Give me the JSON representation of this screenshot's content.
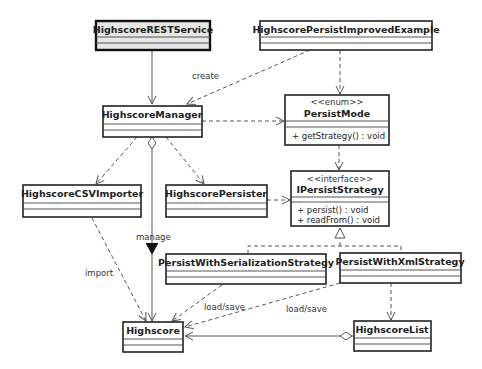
{
  "diagram": {
    "type": "uml-class-diagram",
    "classes": [
      {
        "id": "rest",
        "name": "HighscoreRESTService",
        "highlighted": true
      },
      {
        "id": "example",
        "name": "HighscorePersistImprovedExample"
      },
      {
        "id": "manager",
        "name": "HighscoreManager"
      },
      {
        "id": "mode",
        "stereotype": "<<enum>>",
        "name": "PersistMode",
        "methods": [
          "+ getStrategy() : void"
        ]
      },
      {
        "id": "csv",
        "name": "HighscoreCSVImporter"
      },
      {
        "id": "persister",
        "name": "HighscorePersister"
      },
      {
        "id": "strategy",
        "stereotype": "<<interface>>",
        "name": "IPersistStrategy",
        "methods": [
          "+ persist() : void",
          "+ readFrom() : void"
        ]
      },
      {
        "id": "serial",
        "name": "PersistWithSerializationStrategy"
      },
      {
        "id": "xml",
        "name": "PersistWithXmlStrategy"
      },
      {
        "id": "highscore",
        "name": "Highscore"
      },
      {
        "id": "list",
        "name": "HighscoreList"
      }
    ],
    "relations": [
      {
        "from": "rest",
        "to": "manager",
        "kind": "association"
      },
      {
        "from": "example",
        "to": "manager",
        "kind": "dependency",
        "label": "create"
      },
      {
        "from": "example",
        "to": "mode",
        "kind": "dependency"
      },
      {
        "from": "manager",
        "to": "mode",
        "kind": "dependency"
      },
      {
        "from": "manager",
        "to": "csv",
        "kind": "dependency"
      },
      {
        "from": "manager",
        "to": "persister",
        "kind": "dependency"
      },
      {
        "from": "manager",
        "to": "highscore",
        "kind": "aggregation",
        "label": "manage"
      },
      {
        "from": "mode",
        "to": "strategy",
        "kind": "dependency"
      },
      {
        "from": "persister",
        "to": "strategy",
        "kind": "dependency"
      },
      {
        "from": "serial",
        "to": "strategy",
        "kind": "realization"
      },
      {
        "from": "xml",
        "to": "strategy",
        "kind": "realization"
      },
      {
        "from": "csv",
        "to": "highscore",
        "kind": "dependency",
        "label": "import"
      },
      {
        "from": "serial",
        "to": "highscore",
        "kind": "dependency",
        "label": "load/save"
      },
      {
        "from": "xml",
        "to": "highscore",
        "kind": "dependency",
        "label": "load/save"
      },
      {
        "from": "xml",
        "to": "list",
        "kind": "dependency"
      },
      {
        "from": "list",
        "to": "highscore",
        "kind": "aggregation"
      }
    ],
    "labels": {
      "create": "create",
      "manage": "manage",
      "import": "import",
      "load_save_1": "load/save",
      "load_save_2": "load/save"
    }
  },
  "colors": {
    "line": "#555555",
    "box_border": "#222222",
    "highlight_fill": "#e6e6e6"
  }
}
